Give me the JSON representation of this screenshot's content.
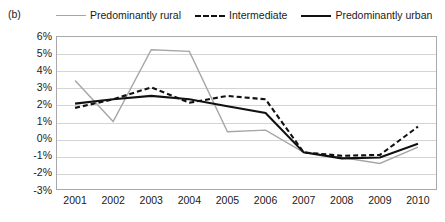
{
  "panel": {
    "label": "(b)"
  },
  "legend": {
    "position": "top",
    "items": [
      {
        "label": "Predominantly rural",
        "style": "solid-thin-gray",
        "color": "#a6a6a6",
        "swatch_icon": "line-swatch-icon"
      },
      {
        "label": "Intermediate",
        "style": "dashed-bold-black",
        "color": "#111111",
        "swatch_icon": "dashed-line-swatch-icon"
      },
      {
        "label": "Predominantly urban",
        "style": "solid-bold-black",
        "color": "#111111",
        "swatch_icon": "line-swatch-icon"
      }
    ]
  },
  "axes": {
    "y_ticks": [
      "6%",
      "5%",
      "4%",
      "3%",
      "2%",
      "1%",
      "0%",
      "-1%",
      "-2%",
      "-3%"
    ],
    "x_ticks": [
      "2001",
      "2002",
      "2003",
      "2004",
      "2005",
      "2006",
      "2007",
      "2008",
      "2009",
      "2010"
    ]
  },
  "chart_data": {
    "type": "line",
    "title": "",
    "subtitle": "",
    "xlabel": "",
    "ylabel": "",
    "panel_label": "(b)",
    "x": [
      2001,
      2002,
      2003,
      2004,
      2005,
      2006,
      2007,
      2008,
      2009,
      2010
    ],
    "categories": [
      "2001",
      "2002",
      "2003",
      "2004",
      "2005",
      "2006",
      "2007",
      "2008",
      "2009",
      "2010"
    ],
    "ylim": [
      -3,
      6
    ],
    "ytick_values": [
      6,
      5,
      4,
      3,
      2,
      1,
      0,
      -1,
      -2,
      -3
    ],
    "ytick_labels": [
      "6%",
      "5%",
      "4%",
      "3%",
      "2%",
      "1%",
      "0%",
      "-1%",
      "-2%",
      "-3%"
    ],
    "y_unit": "%",
    "grid": true,
    "grid_axis": "y",
    "legend_position": "top",
    "series": [
      {
        "name": "Predominantly rural",
        "style": "solid",
        "width": 1.4,
        "color": "#a6a6a6",
        "values": [
          3.4,
          1.0,
          5.2,
          5.1,
          0.4,
          0.5,
          -0.8,
          -1.1,
          -1.45,
          -0.5
        ]
      },
      {
        "name": "Intermediate",
        "style": "dashed",
        "width": 2.1,
        "color": "#111111",
        "values": [
          1.8,
          2.3,
          3.0,
          2.1,
          2.5,
          2.3,
          -0.8,
          -1.0,
          -0.95,
          0.7
        ]
      },
      {
        "name": "Predominantly urban",
        "style": "solid",
        "width": 2.1,
        "color": "#111111",
        "values": [
          2.05,
          2.3,
          2.5,
          2.3,
          1.9,
          1.5,
          -0.8,
          -1.15,
          -1.1,
          -0.3
        ]
      }
    ]
  }
}
